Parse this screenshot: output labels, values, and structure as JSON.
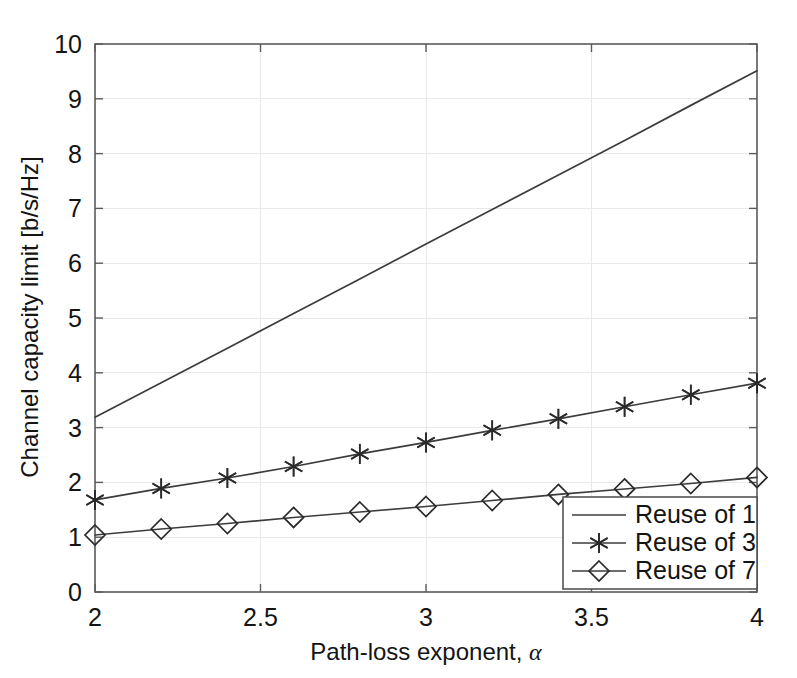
{
  "chart_data": {
    "type": "line",
    "title": "",
    "xlabel": "Path-loss exponent, α",
    "ylabel": "Channel capacity limit [b/s/Hz]",
    "xlim": [
      2,
      4
    ],
    "ylim": [
      0,
      10
    ],
    "xticks": [
      2,
      2.5,
      3,
      3.5,
      4
    ],
    "xtick_labels": [
      "2",
      "2.5",
      "3",
      "3.5",
      "4"
    ],
    "yticks": [
      0,
      1,
      2,
      3,
      4,
      5,
      6,
      7,
      8,
      9,
      10
    ],
    "ytick_labels": [
      "0",
      "1",
      "2",
      "3",
      "4",
      "5",
      "6",
      "7",
      "8",
      "9",
      "10"
    ],
    "grid": true,
    "legend_position": "lower right",
    "x": [
      2,
      2.2,
      2.4,
      2.6,
      2.8,
      3,
      3.2,
      3.4,
      3.6,
      3.8,
      4
    ],
    "series": [
      {
        "name": "Reuse of 1",
        "marker": "none",
        "color": "#3c3c3c",
        "values": [
          3.19,
          3.82,
          4.45,
          5.08,
          5.71,
          6.35,
          6.98,
          7.61,
          8.24,
          8.88,
          9.51
        ]
      },
      {
        "name": "Reuse of 3",
        "marker": "star",
        "color": "#3c3c3c",
        "values": [
          1.68,
          1.89,
          2.08,
          2.29,
          2.52,
          2.73,
          2.95,
          3.16,
          3.38,
          3.6,
          3.81
        ]
      },
      {
        "name": "Reuse of 7",
        "marker": "diamond",
        "color": "#3c3c3c",
        "values": [
          1.04,
          1.15,
          1.25,
          1.36,
          1.46,
          1.56,
          1.67,
          1.78,
          1.88,
          1.98,
          2.09
        ]
      }
    ]
  },
  "legend": {
    "entries": [
      {
        "label": "Reuse of 1",
        "marker": "none"
      },
      {
        "label": "Reuse of 3",
        "marker": "star"
      },
      {
        "label": "Reuse of 7",
        "marker": "diamond"
      }
    ]
  },
  "colors": {
    "background": "#ffffff",
    "axis": "#5b5b5b",
    "grid": "#e9e9e9",
    "line": "#3c3c3c",
    "text": "#141414"
  }
}
